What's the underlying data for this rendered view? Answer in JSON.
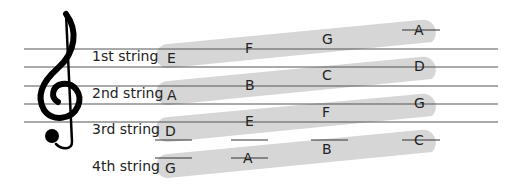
{
  "clef": "treble-clef",
  "colors": {
    "band": "#d6d6d6",
    "line": "#555555",
    "text": "#111111"
  },
  "strings": [
    {
      "label": "1st string",
      "notes": [
        "E",
        "F",
        "G",
        "A"
      ]
    },
    {
      "label": "2nd string",
      "notes": [
        "A",
        "B",
        "C",
        "D"
      ]
    },
    {
      "label": "3rd string",
      "notes": [
        "D",
        "E",
        "F",
        "G"
      ]
    },
    {
      "label": "4th string",
      "notes": [
        "G",
        "A",
        "B",
        "C"
      ]
    }
  ]
}
